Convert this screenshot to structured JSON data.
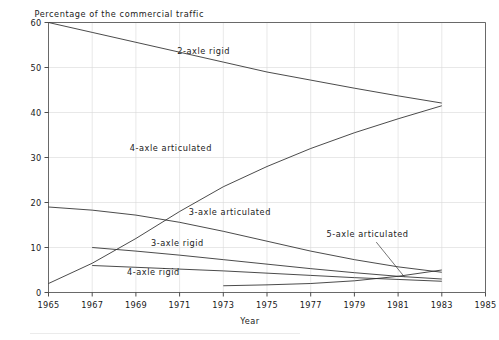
{
  "chart_data": {
    "type": "line",
    "title": "",
    "ylabel": "Percentage of the commercial traffic",
    "xlabel": "Year",
    "xlim": [
      1965,
      1985
    ],
    "ylim": [
      0,
      60
    ],
    "grid": true,
    "legend_position": "inline-annotations",
    "xticks": [
      1965,
      1967,
      1969,
      1971,
      1973,
      1975,
      1977,
      1979,
      1981,
      1983,
      1985
    ],
    "xtick_labels": [
      "1965",
      "1967",
      "1969",
      "1971",
      "1973",
      "1975",
      "1977",
      "1979",
      "1981",
      "1983",
      "1985"
    ],
    "yticks": [
      0,
      10,
      20,
      30,
      40,
      50,
      60
    ],
    "ytick_labels": [
      "0",
      "10",
      "20",
      "30",
      "40",
      "50",
      "60"
    ],
    "series": [
      {
        "name": "2-axle rigid",
        "label": "2-axle rigid",
        "label_x": 1972.1,
        "label_y": 53.0,
        "x": [
          1965,
          1967,
          1969,
          1971,
          1973,
          1975,
          1977,
          1979,
          1981,
          1983
        ],
        "values": [
          60.0,
          57.8,
          55.6,
          53.4,
          51.2,
          49.0,
          47.2,
          45.4,
          43.7,
          42.1
        ]
      },
      {
        "name": "4-axle articulated",
        "label": "4-axle articulated",
        "label_x": 1970.6,
        "label_y": 31.5,
        "x": [
          1965,
          1967,
          1969,
          1971,
          1973,
          1975,
          1977,
          1979,
          1981,
          1983
        ],
        "values": [
          2.0,
          6.5,
          12.0,
          18.0,
          23.5,
          28.0,
          32.0,
          35.5,
          38.6,
          41.5
        ]
      },
      {
        "name": "3-axle articulated",
        "label": "3-axle articulated",
        "label_x": 1973.3,
        "label_y": 17.2,
        "x": [
          1965,
          1967,
          1969,
          1971,
          1973,
          1975,
          1977,
          1979,
          1981,
          1983
        ],
        "values": [
          19.0,
          18.3,
          17.2,
          15.6,
          13.6,
          11.4,
          9.2,
          7.3,
          5.7,
          4.5
        ]
      },
      {
        "name": "3-axle rigid",
        "label": "3-axle rigid",
        "label_x": 1970.9,
        "label_y": 10.3,
        "x": [
          1967,
          1969,
          1971,
          1973,
          1975,
          1977,
          1979,
          1981,
          1983
        ],
        "values": [
          10.0,
          9.2,
          8.3,
          7.3,
          6.3,
          5.3,
          4.4,
          3.6,
          3.0
        ]
      },
      {
        "name": "4-axle rigid",
        "label": "4-axle rigid",
        "label_x": 1969.8,
        "label_y": 4.0,
        "x": [
          1967,
          1969,
          1971,
          1973,
          1975,
          1977,
          1979,
          1981,
          1983
        ],
        "values": [
          6.0,
          5.6,
          5.2,
          4.8,
          4.3,
          3.8,
          3.3,
          2.9,
          2.5
        ]
      },
      {
        "name": "5-axle articulated",
        "label": "5-axle articulated",
        "label_x": 1979.6,
        "label_y": 12.4,
        "x": [
          1973,
          1975,
          1977,
          1979,
          1981,
          1983
        ],
        "values": [
          1.5,
          1.7,
          2.0,
          2.6,
          3.6,
          5.0
        ],
        "leader": {
          "x1": 1980.0,
          "y1": 11.2,
          "x2": 1981.3,
          "y2": 3.4
        }
      }
    ]
  }
}
